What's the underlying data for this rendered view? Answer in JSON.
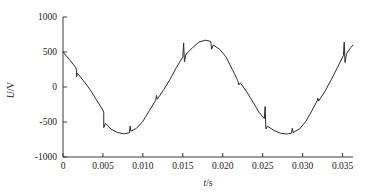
{
  "chart_data": {
    "type": "line",
    "title": "",
    "subtitle": "",
    "xlabel": "t/s",
    "ylabel": "U/V",
    "xlim": [
      0,
      0.0363
    ],
    "ylim": [
      -1000,
      1000
    ],
    "grid": false,
    "legend": null,
    "x_ticks": [
      0,
      0.005,
      0.01,
      0.015,
      0.02,
      0.025,
      0.03,
      0.035
    ],
    "x_tick_labels": [
      "0",
      "0.005",
      "0.010",
      "0.015",
      "0.020",
      "0.025",
      "0.030",
      "0.035"
    ],
    "y_ticks": [
      -1000,
      -500,
      0,
      500,
      1000
    ],
    "y_tick_labels": [
      "-1000",
      "-500",
      "0",
      "500",
      "1000"
    ],
    "series": [
      {
        "name": "line voltage",
        "color": "#2b2b2b",
        "description": "Sinusoidal AC line voltage with commutation notches/spikes",
        "waveform": {
          "amplitude": 670,
          "frequency_hz": 50,
          "phase_deg": 48,
          "period_s": 0.02
        },
        "notch_times_s": [
          0.0017,
          0.0051,
          0.0084,
          0.0117,
          0.0151,
          0.0185,
          0.0218,
          0.0252,
          0.0285,
          0.0318,
          0.0352
        ],
        "notch_values_v": [
          230,
          -390,
          -560,
          -120,
          470,
          640,
          80,
          -370,
          -590,
          -160,
          520
        ],
        "points": [
          {
            "t": 0.0,
            "u": 500
          },
          {
            "t": 0.0008,
            "u": 392
          },
          {
            "t": 0.0016,
            "u": 278
          },
          {
            "t": 0.0017,
            "u": 230
          },
          {
            "t": 0.0017,
            "u": 150
          },
          {
            "t": 0.0018,
            "u": 196
          },
          {
            "t": 0.0026,
            "u": 84
          },
          {
            "t": 0.0034,
            "u": -40
          },
          {
            "t": 0.0042,
            "u": -186
          },
          {
            "t": 0.005,
            "u": -330
          },
          {
            "t": 0.0051,
            "u": -360
          },
          {
            "t": 0.0051,
            "u": -580
          },
          {
            "t": 0.0053,
            "u": -520
          },
          {
            "t": 0.006,
            "u": -600
          },
          {
            "t": 0.0068,
            "u": -650
          },
          {
            "t": 0.0076,
            "u": -668
          },
          {
            "t": 0.0083,
            "u": -655
          },
          {
            "t": 0.0084,
            "u": -560
          },
          {
            "t": 0.0085,
            "u": -630
          },
          {
            "t": 0.0092,
            "u": -590
          },
          {
            "t": 0.01,
            "u": -490
          },
          {
            "t": 0.0108,
            "u": -340
          },
          {
            "t": 0.0116,
            "u": -190
          },
          {
            "t": 0.0117,
            "u": -120
          },
          {
            "t": 0.0118,
            "u": -175
          },
          {
            "t": 0.0126,
            "u": -40
          },
          {
            "t": 0.0134,
            "u": 110
          },
          {
            "t": 0.0142,
            "u": 280
          },
          {
            "t": 0.015,
            "u": 430
          },
          {
            "t": 0.0151,
            "u": 630
          },
          {
            "t": 0.0152,
            "u": 360
          },
          {
            "t": 0.0154,
            "u": 470
          },
          {
            "t": 0.0162,
            "u": 560
          },
          {
            "t": 0.017,
            "u": 640
          },
          {
            "t": 0.0178,
            "u": 668
          },
          {
            "t": 0.0184,
            "u": 655
          },
          {
            "t": 0.0185,
            "u": 650
          },
          {
            "t": 0.0186,
            "u": 540
          },
          {
            "t": 0.0188,
            "u": 600
          },
          {
            "t": 0.0196,
            "u": 540
          },
          {
            "t": 0.0204,
            "u": 430
          },
          {
            "t": 0.0212,
            "u": 250
          },
          {
            "t": 0.0218,
            "u": 110
          },
          {
            "t": 0.0219,
            "u": 80
          },
          {
            "t": 0.022,
            "u": 30
          },
          {
            "t": 0.0222,
            "u": 60
          },
          {
            "t": 0.023,
            "u": -70
          },
          {
            "t": 0.0238,
            "u": -220
          },
          {
            "t": 0.0246,
            "u": -370
          },
          {
            "t": 0.0252,
            "u": -450
          },
          {
            "t": 0.0253,
            "u": -280
          },
          {
            "t": 0.0254,
            "u": -600
          },
          {
            "t": 0.0256,
            "u": -560
          },
          {
            "t": 0.0264,
            "u": -620
          },
          {
            "t": 0.0272,
            "u": -660
          },
          {
            "t": 0.028,
            "u": -672
          },
          {
            "t": 0.0286,
            "u": -660
          },
          {
            "t": 0.0287,
            "u": -590
          },
          {
            "t": 0.0288,
            "u": -650
          },
          {
            "t": 0.0296,
            "u": -600
          },
          {
            "t": 0.0304,
            "u": -490
          },
          {
            "t": 0.0312,
            "u": -330
          },
          {
            "t": 0.0318,
            "u": -200
          },
          {
            "t": 0.0319,
            "u": -160
          },
          {
            "t": 0.032,
            "u": -200
          },
          {
            "t": 0.0328,
            "u": -60
          },
          {
            "t": 0.0336,
            "u": 110
          },
          {
            "t": 0.0344,
            "u": 290
          },
          {
            "t": 0.0351,
            "u": 450
          },
          {
            "t": 0.0352,
            "u": 640
          },
          {
            "t": 0.0353,
            "u": 350
          },
          {
            "t": 0.0355,
            "u": 480
          },
          {
            "t": 0.036,
            "u": 560
          },
          {
            "t": 0.0363,
            "u": 600
          }
        ]
      }
    ]
  },
  "axes": {
    "x_title": "t/s",
    "y_title": "U/V"
  }
}
